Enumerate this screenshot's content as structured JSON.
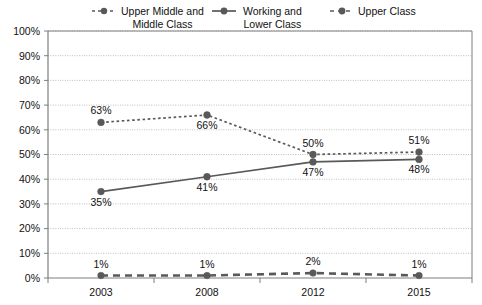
{
  "chart_data": {
    "type": "line",
    "title": "",
    "xlabel": "",
    "ylabel": "",
    "categories": [
      "2003",
      "2008",
      "2012",
      "2015"
    ],
    "ylim": [
      0,
      100
    ],
    "ytick_labels": [
      "0%",
      "10%",
      "20%",
      "30%",
      "40%",
      "50%",
      "60%",
      "70%",
      "80%",
      "90%",
      "100%"
    ],
    "ytick_values": [
      0,
      10,
      20,
      30,
      40,
      50,
      60,
      70,
      80,
      90,
      100
    ],
    "grid": true,
    "legend_position": "top",
    "series": [
      {
        "name": "Upper Middle and Middle Class",
        "legend_label_line1": "Upper Middle and",
        "legend_label_line2": "Middle Class",
        "line_style": "dotted",
        "color": "#595959",
        "values": [
          63,
          66,
          50,
          51
        ],
        "data_labels": [
          "63%",
          "66%",
          "50%",
          "51%"
        ],
        "label_positions": [
          "above",
          "below",
          "above",
          "above"
        ]
      },
      {
        "name": "Working and Lower Class",
        "legend_label_line1": "Working and",
        "legend_label_line2": "Lower Class",
        "line_style": "solid",
        "color": "#595959",
        "values": [
          35,
          41,
          47,
          48
        ],
        "data_labels": [
          "35%",
          "41%",
          "47%",
          "48%"
        ],
        "label_positions": [
          "below",
          "below",
          "below",
          "below"
        ]
      },
      {
        "name": "Upper Class",
        "legend_label_line1": "Upper Class",
        "legend_label_line2": "",
        "line_style": "dashed",
        "color": "#595959",
        "values": [
          1,
          1,
          2,
          1
        ],
        "data_labels": [
          "1%",
          "1%",
          "2%",
          "1%"
        ],
        "label_positions": [
          "above",
          "above",
          "above",
          "above"
        ]
      }
    ]
  },
  "colors": {
    "plot_border": "#7f7f7f",
    "gridline": "#bfbfbf",
    "marker": "#595959",
    "text": "#111111",
    "background": "#ffffff"
  }
}
